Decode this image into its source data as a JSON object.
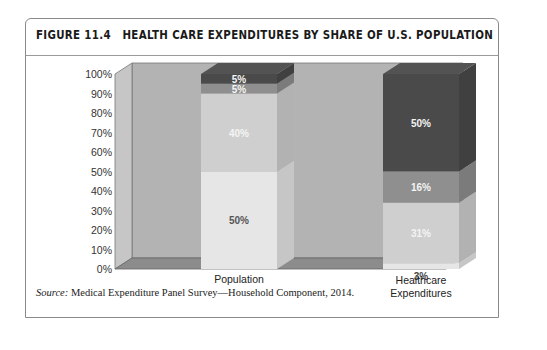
{
  "figure": {
    "number_label": "FIGURE 11.4",
    "title": "HEALTH CARE EXPENDITURES BY SHARE OF U.S. POPULATION",
    "source_label": "Source:",
    "source_text": " Medical Expenditure Panel Survey—Household Component, 2014."
  },
  "chart_data": {
    "type": "bar",
    "subtype": "stacked-3d-100-percent",
    "title": "HEALTH CARE EXPENDITURES BY SHARE OF U.S. POPULATION",
    "xlabel": "",
    "ylabel": "",
    "categories": [
      "Population",
      "Healthcare\nExpenditures"
    ],
    "category_lines": [
      [
        "Population"
      ],
      [
        "Healthcare",
        "Expenditures"
      ]
    ],
    "ylim": [
      0,
      100
    ],
    "yticks": [
      0,
      10,
      20,
      30,
      40,
      50,
      60,
      70,
      80,
      90,
      100
    ],
    "ytick_labels": [
      "0%",
      "10%",
      "20%",
      "30%",
      "40%",
      "50%",
      "60%",
      "70%",
      "80%",
      "90%",
      "100%"
    ],
    "grid": false,
    "legend": null,
    "series": [
      {
        "name": "segment-1",
        "color": "#e6e6e6",
        "label_color": "#555555",
        "values": [
          50,
          3
        ],
        "labels": [
          "50%",
          "3%"
        ]
      },
      {
        "name": "segment-2",
        "color": "#cfcfcf",
        "label_color": "#f4f4f4",
        "values": [
          40,
          31
        ],
        "labels": [
          "40%",
          "31%"
        ]
      },
      {
        "name": "segment-3",
        "color": "#8f8f8f",
        "label_color": "#f4f4f4",
        "values": [
          5,
          16
        ],
        "labels": [
          "5%",
          "16%"
        ]
      },
      {
        "name": "segment-4",
        "color": "#4a4a4a",
        "label_color": "#f4f4f4",
        "values": [
          5,
          50
        ],
        "labels": [
          "5%",
          "50%"
        ]
      }
    ],
    "colors": {
      "wall": "#b3b3b3",
      "side_wall": "#c6c6c6",
      "floor": "#8c8c8c",
      "axis_text": "#333333"
    }
  }
}
